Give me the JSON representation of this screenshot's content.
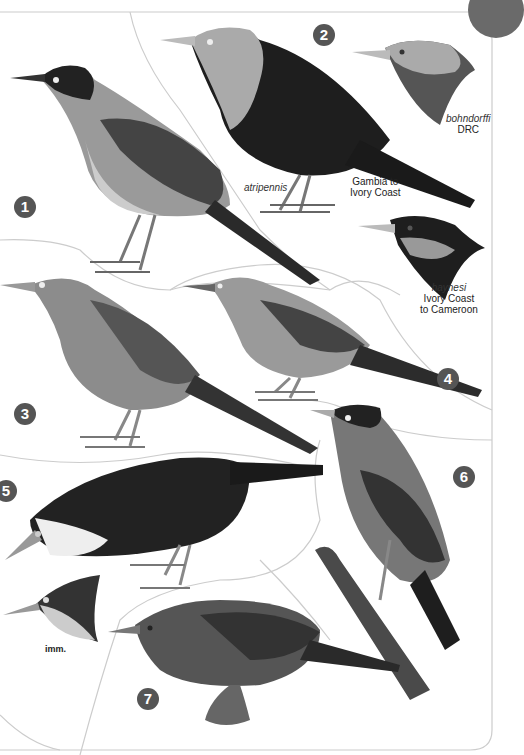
{
  "plate": {
    "corner_tab_color": "#6a6a6a",
    "badge_color": "#555555",
    "numbers": [
      "1",
      "2",
      "3",
      "4",
      "5",
      "6",
      "7"
    ]
  },
  "labels": {
    "atripennis": "atripennis",
    "gambia_range": "Gambia to",
    "gambia_range_2": "Ivory Coast",
    "bohndorffi": "bohndorffi",
    "bohndorffi_range": "DRC",
    "haynesi": "haynesi",
    "haynesi_range": "Ivory Coast",
    "haynesi_range_2": "to Cameroon",
    "imm": "imm."
  }
}
